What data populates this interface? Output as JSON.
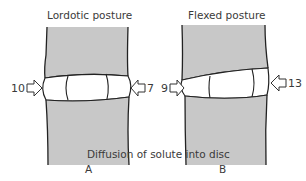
{
  "panels": [
    {
      "id": "A",
      "title": "Lordotic posture",
      "letter": "A",
      "left_value": "10",
      "right_value": "7"
    },
    {
      "id": "B",
      "title": "Flexed posture",
      "letter": "B",
      "left_value": "9",
      "right_value": "13"
    }
  ],
  "caption": "Diffusion of solute into disc",
  "colors": {
    "bone": "#c8c8c8",
    "outline": "#222222",
    "disc": "#ffffff"
  }
}
